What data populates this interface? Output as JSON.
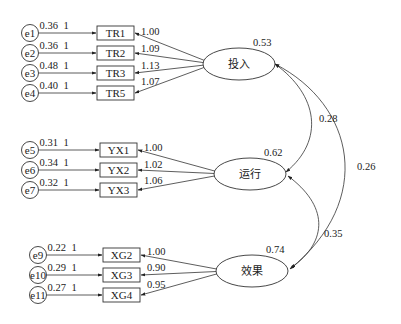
{
  "diagram": {
    "type": "structural-equation-model",
    "latents": [
      {
        "id": "L1",
        "label": "投入",
        "variance": "0.53",
        "cx": 239,
        "cy": 64
      },
      {
        "id": "L2",
        "label": "运行",
        "variance": "0.62",
        "cx": 250,
        "cy": 174
      },
      {
        "id": "L3",
        "label": "效果",
        "variance": "0.74",
        "cx": 252,
        "cy": 271
      }
    ],
    "indicators": [
      {
        "label": "TR1",
        "latent": "L1",
        "loading": "1.00",
        "error": "e1",
        "error_variance": "0.36",
        "error_path": "1",
        "y": 33,
        "bx": 97
      },
      {
        "label": "TR2",
        "latent": "L1",
        "loading": "1.09",
        "error": "e2",
        "error_variance": "0.36",
        "error_path": "1",
        "y": 53,
        "bx": 97
      },
      {
        "label": "TR3",
        "latent": "L1",
        "loading": "1.13",
        "error": "e3",
        "error_variance": "0.48",
        "error_path": "1",
        "y": 73,
        "bx": 97
      },
      {
        "label": "TR5",
        "latent": "L1",
        "loading": "1.07",
        "error": "e4",
        "error_variance": "0.40",
        "error_path": "1",
        "y": 93,
        "bx": 97
      },
      {
        "label": "YX1",
        "latent": "L2",
        "loading": "1.00",
        "error": "e5",
        "error_variance": "0.31",
        "error_path": "1",
        "y": 150,
        "bx": 100
      },
      {
        "label": "YX2",
        "latent": "L2",
        "loading": "1.02",
        "error": "e6",
        "error_variance": "0.34",
        "error_path": "1",
        "y": 170,
        "bx": 100
      },
      {
        "label": "YX3",
        "latent": "L2",
        "loading": "1.06",
        "error": "e7",
        "error_variance": "0.32",
        "error_path": "1",
        "y": 190,
        "bx": 100
      },
      {
        "label": "XG2",
        "latent": "L3",
        "loading": "1.00",
        "error": "e9",
        "error_variance": "0.22",
        "error_path": "1",
        "y": 255,
        "bx": 103
      },
      {
        "label": "XG3",
        "latent": "L3",
        "loading": "0.90",
        "error": "e10",
        "error_variance": "0.29",
        "error_path": "1",
        "y": 275,
        "bx": 103
      },
      {
        "label": "XG4",
        "latent": "L3",
        "loading": "0.95",
        "error": "e11",
        "error_variance": "0.27",
        "error_path": "1",
        "y": 295,
        "bx": 103
      }
    ],
    "covariances": [
      {
        "from": "投入",
        "to": "运行",
        "value": "0.28"
      },
      {
        "from": "投入",
        "to": "效果",
        "value": "0.26"
      },
      {
        "from": "运行",
        "to": "效果",
        "value": "0.35"
      }
    ]
  }
}
